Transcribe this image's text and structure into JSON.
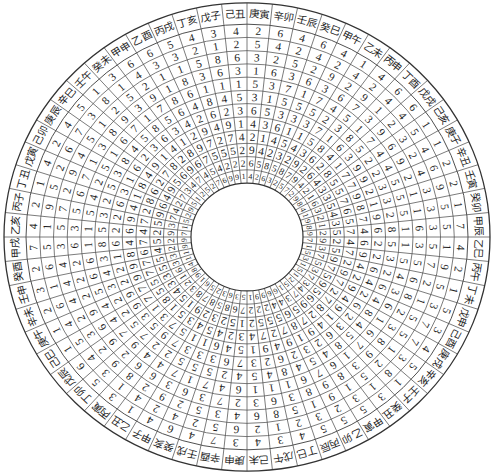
{
  "colors": {
    "grid": "#4d4d4d",
    "outline": "#333333",
    "text": "#1e1e1e",
    "background": "#ffffff"
  },
  "wheel": {
    "segments": [
      {
        "label": "庚寅",
        "rings": [
          2,
          5,
          3,
          1,
          5,
          3,
          6,
          4,
          2,
          9,
          6,
          4
        ]
      },
      {
        "label": "辛卯",
        "rings": [
          6,
          4,
          2,
          6,
          3,
          1,
          5,
          3,
          1,
          4,
          5,
          2
        ]
      },
      {
        "label": "壬辰",
        "rings": [
          4,
          2,
          5,
          3,
          7,
          5,
          3,
          6,
          4,
          2,
          8,
          6
        ]
      },
      {
        "label": "癸巳",
        "rings": [
          6,
          4,
          2,
          6,
          1,
          5,
          3,
          1,
          5,
          3,
          5,
          3
        ]
      },
      {
        "label": "甲午",
        "rings": [
          4,
          2,
          9,
          3,
          7,
          5,
          3,
          1,
          4,
          2,
          8,
          2
        ]
      },
      {
        "label": "乙未",
        "rings": [
          1,
          4,
          2,
          6,
          4,
          2,
          7,
          5,
          3,
          9,
          7,
          5
        ]
      },
      {
        "label": "丙申",
        "rings": [
          4,
          2,
          9,
          7,
          5,
          3,
          1,
          8,
          6,
          2,
          9,
          7
        ]
      },
      {
        "label": "丁酉",
        "rings": [
          6,
          4,
          1,
          3,
          1,
          8,
          6,
          4,
          2,
          6,
          4,
          2
        ]
      },
      {
        "label": "戊戌",
        "rings": [
          6,
          4,
          2,
          9,
          7,
          5,
          3,
          1,
          8,
          4,
          2,
          9
        ]
      },
      {
        "label": "己亥",
        "rings": [
          1,
          5,
          3,
          6,
          4,
          2,
          9,
          7,
          5,
          3,
          1,
          8
        ]
      },
      {
        "label": "庚子",
        "rings": [
          1,
          4,
          2,
          9,
          4,
          2,
          9,
          7,
          5,
          3,
          6,
          4
        ]
      },
      {
        "label": "辛丑",
        "rings": [
          2,
          6,
          4,
          2,
          5,
          3,
          2,
          9,
          7,
          5,
          3,
          1
        ]
      },
      {
        "label": "壬寅",
        "rings": [
          2,
          9,
          3,
          1,
          5,
          3,
          1,
          8,
          6,
          4,
          2,
          9
        ]
      },
      {
        "label": "癸卯",
        "rings": [
          1,
          5,
          3,
          1,
          5,
          2,
          9,
          7,
          5,
          3,
          1,
          8
        ]
      },
      {
        "label": "甲辰",
        "rings": [
          7,
          5,
          3,
          6,
          1,
          8,
          6,
          4,
          7,
          5,
          2,
          9
        ]
      },
      {
        "label": "乙巳",
        "rings": [
          4,
          1,
          5,
          3,
          1,
          5,
          2,
          6,
          4,
          2,
          9,
          7
        ]
      },
      {
        "label": "丙午",
        "rings": [
          2,
          9,
          7,
          5,
          5,
          3,
          2,
          9,
          7,
          5,
          3,
          1
        ]
      },
      {
        "label": "丁未",
        "rings": [
          1,
          5,
          2,
          6,
          4,
          2,
          6,
          4,
          2,
          9,
          7,
          5
        ]
      },
      {
        "label": "戊申",
        "rings": [
          5,
          3,
          1,
          8,
          3,
          6,
          4,
          2,
          9,
          7,
          5,
          3
        ]
      },
      {
        "label": "己酉",
        "rings": [
          3,
          7,
          5,
          2,
          6,
          4,
          2,
          9,
          7,
          5,
          3,
          1
        ]
      },
      {
        "label": "庚戌",
        "rings": [
          4,
          7,
          5,
          3,
          1,
          8,
          6,
          4,
          2,
          9,
          7,
          5
        ]
      },
      {
        "label": "辛亥",
        "rings": [
          5,
          3,
          1,
          8,
          6,
          4,
          2,
          9,
          7,
          5,
          3,
          1
        ]
      },
      {
        "label": "壬子",
        "rings": [
          1,
          8,
          2,
          9,
          7,
          5,
          3,
          1,
          8,
          6,
          4,
          2
        ]
      },
      {
        "label": "癸丑",
        "rings": [
          3,
          1,
          5,
          3,
          1,
          8,
          6,
          4,
          2,
          9,
          7,
          5
        ]
      },
      {
        "label": "甲寅",
        "rings": [
          5,
          3,
          1,
          8,
          6,
          4,
          2,
          9,
          7,
          5,
          3,
          1
        ]
      },
      {
        "label": "乙卯",
        "rings": [
          5,
          2,
          9,
          9,
          7,
          5,
          3,
          1,
          8,
          6,
          4,
          6
        ]
      },
      {
        "label": "丙辰",
        "rings": [
          5,
          3,
          1,
          8,
          6,
          4,
          2,
          9,
          7,
          5,
          4,
          6
        ]
      },
      {
        "label": "丁巳",
        "rings": [
          4,
          2,
          5,
          3,
          1,
          8,
          6,
          4,
          2,
          5,
          2,
          9
        ]
      },
      {
        "label": "戊午",
        "rings": [
          3,
          1,
          8,
          6,
          1,
          4,
          2,
          9,
          7,
          5,
          2,
          9
        ]
      },
      {
        "label": "己未",
        "rings": [
          4,
          2,
          6,
          3,
          1,
          5,
          3,
          1,
          4,
          2,
          2,
          1
        ]
      },
      {
        "label": "庚申",
        "rings": [
          3,
          6,
          4,
          2,
          6,
          4,
          7,
          5,
          3,
          1,
          7,
          5
        ]
      },
      {
        "label": "辛酉",
        "rings": [
          7,
          5,
          3,
          7,
          4,
          2,
          6,
          4,
          2,
          5,
          6,
          3
        ]
      },
      {
        "label": "壬戌",
        "rings": [
          4,
          2,
          5,
          3,
          7,
          5,
          3,
          6,
          4,
          2,
          8,
          6
        ]
      },
      {
        "label": "癸亥",
        "rings": [
          6,
          4,
          2,
          6,
          1,
          5,
          3,
          1,
          5,
          3,
          5,
          3
        ]
      },
      {
        "label": "甲子",
        "rings": [
          4,
          2,
          9,
          3,
          7,
          5,
          3,
          1,
          4,
          2,
          8,
          2
        ]
      },
      {
        "label": "乙丑",
        "rings": [
          1,
          4,
          2,
          6,
          4,
          2,
          7,
          5,
          3,
          9,
          7,
          5
        ]
      },
      {
        "label": "丙寅",
        "rings": [
          3,
          1,
          8,
          6,
          4,
          2,
          9,
          7,
          5,
          1,
          8,
          6
        ]
      },
      {
        "label": "丁卯",
        "rings": [
          5,
          3,
          9,
          2,
          9,
          7,
          5,
          3,
          1,
          5,
          3,
          1
        ]
      },
      {
        "label": "戊辰",
        "rings": [
          6,
          4,
          2,
          9,
          7,
          5,
          3,
          1,
          8,
          4,
          2,
          9
        ]
      },
      {
        "label": "己巳",
        "rings": [
          1,
          5,
          3,
          6,
          4,
          2,
          9,
          7,
          5,
          3,
          1,
          8
        ]
      },
      {
        "label": "庚午",
        "rings": [
          1,
          4,
          2,
          9,
          4,
          2,
          9,
          7,
          5,
          3,
          6,
          4
        ]
      },
      {
        "label": "辛未",
        "rings": [
          2,
          6,
          4,
          2,
          5,
          3,
          2,
          9,
          7,
          5,
          3,
          1
        ]
      },
      {
        "label": "壬申",
        "rings": [
          3,
          1,
          4,
          2,
          6,
          4,
          2,
          9,
          7,
          5,
          3,
          1
        ]
      },
      {
        "label": "癸酉",
        "rings": [
          2,
          6,
          4,
          2,
          6,
          3,
          1,
          8,
          6,
          4,
          2,
          9
        ]
      },
      {
        "label": "甲戌",
        "rings": [
          7,
          5,
          3,
          6,
          1,
          8,
          6,
          4,
          7,
          5,
          2,
          9
        ]
      },
      {
        "label": "乙亥",
        "rings": [
          4,
          1,
          5,
          3,
          1,
          5,
          2,
          6,
          4,
          2,
          9,
          7
        ]
      },
      {
        "label": "丙子",
        "rings": [
          2,
          9,
          7,
          5,
          5,
          3,
          2,
          9,
          7,
          5,
          3,
          1
        ]
      },
      {
        "label": "丁丑",
        "rings": [
          1,
          5,
          2,
          6,
          4,
          2,
          6,
          4,
          2,
          9,
          7,
          5
        ]
      },
      {
        "label": "戊寅",
        "rings": [
          4,
          2,
          9,
          7,
          2,
          5,
          3,
          1,
          8,
          6,
          4,
          2
        ]
      },
      {
        "label": "己卯",
        "rings": [
          2,
          6,
          4,
          1,
          5,
          3,
          1,
          8,
          6,
          4,
          2,
          9
        ]
      },
      {
        "label": "庚辰",
        "rings": [
          4,
          7,
          5,
          3,
          1,
          8,
          6,
          4,
          2,
          9,
          7,
          5
        ]
      },
      {
        "label": "辛巳",
        "rings": [
          5,
          3,
          1,
          8,
          6,
          4,
          2,
          9,
          7,
          5,
          3,
          1
        ]
      },
      {
        "label": "壬午",
        "rings": [
          1,
          8,
          2,
          9,
          7,
          5,
          3,
          1,
          8,
          6,
          4,
          2
        ]
      },
      {
        "label": "癸未",
        "rings": [
          3,
          1,
          5,
          3,
          1,
          8,
          6,
          4,
          2,
          9,
          7,
          5
        ]
      },
      {
        "label": "甲申",
        "rings": [
          6,
          4,
          2,
          9,
          7,
          5,
          3,
          1,
          8,
          6,
          4,
          2
        ]
      },
      {
        "label": "乙酉",
        "rings": [
          6,
          3,
          1,
          1,
          8,
          6,
          4,
          2,
          9,
          7,
          5,
          7
        ]
      },
      {
        "label": "丙戌",
        "rings": [
          5,
          3,
          1,
          8,
          6,
          4,
          2,
          9,
          7,
          5,
          4,
          6
        ]
      },
      {
        "label": "丁亥",
        "rings": [
          4,
          2,
          5,
          3,
          1,
          8,
          6,
          4,
          2,
          5,
          2,
          9
        ]
      },
      {
        "label": "戊子",
        "rings": [
          3,
          1,
          8,
          6,
          1,
          4,
          2,
          9,
          7,
          5,
          2,
          9
        ]
      },
      {
        "label": "己丑",
        "rings": [
          4,
          2,
          6,
          3,
          1,
          5,
          3,
          1,
          4,
          2,
          2,
          1
        ]
      }
    ]
  }
}
